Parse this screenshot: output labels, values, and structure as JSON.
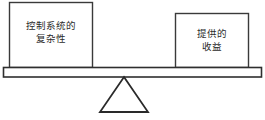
{
  "diagram": {
    "type": "balance-scale",
    "title": "",
    "background_color": "#ffffff",
    "line_color": "#2f2f2f",
    "text_color": "#2b2b2b",
    "left_pan": {
      "label_lines": [
        "控制系统的",
        "复杂性"
      ],
      "label_full": "控制系统的复杂性"
    },
    "right_pan": {
      "label_lines": [
        "提供的",
        "收益"
      ],
      "label_full": "提供的收益"
    },
    "beam": {
      "name": "balance-beam"
    },
    "fulcrum": {
      "name": "triangular-fulcrum"
    }
  }
}
